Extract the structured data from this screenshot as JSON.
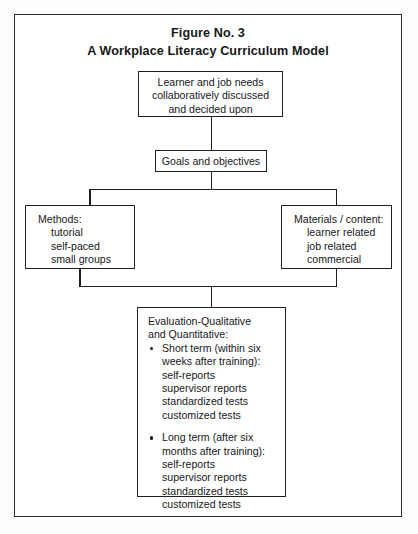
{
  "figure": {
    "title_line1": "Figure No. 3",
    "title_line2": "A Workplace Literacy Curriculum Model"
  },
  "nodes": {
    "needs": {
      "line1": "Learner and job needs",
      "line2": "collaboratively discussed",
      "line3": "and decided upon"
    },
    "goals": {
      "line1": "Goals and objectives"
    },
    "methods": {
      "heading": "Methods:",
      "items": [
        "tutorial",
        "self-paced",
        "small groups"
      ]
    },
    "materials": {
      "heading": "Materials / content:",
      "items": [
        "learner related",
        "job related",
        "commercial"
      ]
    },
    "evaluation": {
      "heading_line1": "Evaluation-Qualitative",
      "heading_line2": "and Quantitative:",
      "groups": [
        {
          "bullet_line1": "Short term (within six",
          "bullet_line2": "weeks after training):",
          "items": [
            "self-reports",
            "supervisor reports",
            "standardized tests",
            "customized tests"
          ]
        },
        {
          "bullet_line1": "Long term (after six",
          "bullet_line2": "months after training):",
          "items": [
            "self-reports",
            "supervisor reports",
            "standardized tests",
            "customized tests"
          ]
        }
      ]
    }
  },
  "colors": {
    "ink": "#17181a",
    "stroke": "#1e1f21",
    "page": "#ffffff"
  }
}
